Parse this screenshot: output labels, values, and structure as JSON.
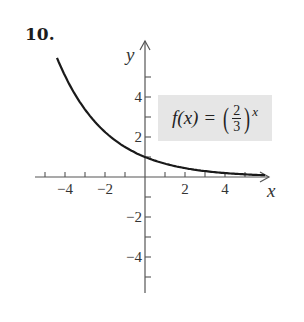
{
  "problem_number": "10.",
  "formula": {
    "lhs": "f(x)",
    "equals": "=",
    "numerator": "2",
    "denominator": "3",
    "exponent": "x",
    "text": "f(x) = (2/3)^x"
  },
  "chart_data": {
    "type": "line",
    "xlabel": "x",
    "ylabel": "y",
    "xlim": [
      -5.5,
      6.2
    ],
    "ylim": [
      -5.8,
      6.8
    ],
    "grid": false,
    "x_ticks": [
      -5,
      -4,
      -3,
      -2,
      -1,
      1,
      2,
      3,
      4,
      5
    ],
    "x_tick_labels": [
      {
        "value": -4,
        "label": "−4"
      },
      {
        "value": -2,
        "label": "−2"
      },
      {
        "value": 2,
        "label": "2"
      },
      {
        "value": 4,
        "label": "4"
      }
    ],
    "y_ticks": [
      -5,
      -4,
      -3,
      -2,
      -1,
      1,
      2,
      3,
      4,
      5
    ],
    "y_tick_labels": [
      {
        "value": 4,
        "label": "4"
      },
      {
        "value": 2,
        "label": "2"
      },
      {
        "value": -2,
        "label": "−2"
      },
      {
        "value": -4,
        "label": "−4"
      }
    ],
    "series": [
      {
        "name": "f(x) = (2/3)^x",
        "x": [
          -4.4,
          -4,
          -3,
          -2,
          -1,
          0,
          1,
          2,
          3,
          4,
          5,
          6
        ],
        "y": [
          5.96,
          5.06,
          3.38,
          2.25,
          1.5,
          1.0,
          0.67,
          0.44,
          0.3,
          0.2,
          0.13,
          0.09
        ]
      }
    ],
    "annotations": [
      "f(x) = (2/3)^x"
    ],
    "legend_position": "boxed label upper right"
  }
}
